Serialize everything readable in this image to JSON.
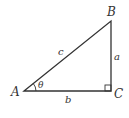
{
  "diagram": {
    "type": "right-triangle",
    "vertices": {
      "A": {
        "label": "A",
        "x": 24,
        "y": 91
      },
      "B": {
        "label": "B",
        "x": 111,
        "y": 21
      },
      "C": {
        "label": "C",
        "x": 111,
        "y": 91
      }
    },
    "sides": {
      "a": {
        "label": "a",
        "between": [
          "B",
          "C"
        ]
      },
      "b": {
        "label": "b",
        "between": [
          "A",
          "C"
        ]
      },
      "c": {
        "label": "c",
        "between": [
          "A",
          "B"
        ]
      }
    },
    "angle": {
      "label": "θ",
      "at": "A"
    },
    "right_angle_at": "C",
    "colors": {
      "stroke": "#333333",
      "background": "#ffffff"
    }
  }
}
